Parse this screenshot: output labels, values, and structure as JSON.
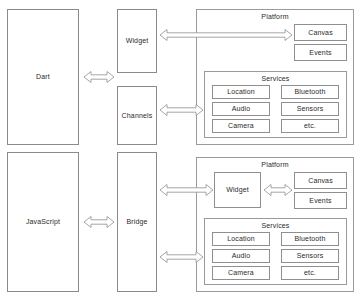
{
  "diagram": {
    "caption": "",
    "colors": {
      "box_border": "#8a8a8a",
      "container_border": "#9a9a9a",
      "arrow_stroke": "#8f8f8f",
      "arrow_fill": "#ffffff",
      "text": "#2a2a2a",
      "background": "#ffffff"
    },
    "panels": [
      {
        "id": "dart-panel",
        "language": {
          "label": "Dart"
        },
        "middle_boxes": [
          {
            "id": "widget",
            "label": "Widget"
          },
          {
            "id": "channels",
            "label": "Channels"
          }
        ],
        "platform": {
          "label": "Platform",
          "has_widget": false,
          "widget_label": "",
          "render_boxes": [
            {
              "id": "canvas",
              "label": "Canvas"
            },
            {
              "id": "events",
              "label": "Events"
            }
          ],
          "services": {
            "label": "Services",
            "left_column": [
              {
                "id": "location",
                "label": "Location"
              },
              {
                "id": "audio",
                "label": "Audio"
              },
              {
                "id": "camera",
                "label": "Camera"
              }
            ],
            "right_column": [
              {
                "id": "bluetooth",
                "label": "Bluetooth"
              },
              {
                "id": "sensors",
                "label": "Sensors"
              },
              {
                "id": "etc",
                "label": "etc."
              }
            ]
          }
        }
      },
      {
        "id": "javascript-panel",
        "language": {
          "label": "JavaScript"
        },
        "middle_boxes": [
          {
            "id": "bridge",
            "label": "Bridge"
          }
        ],
        "platform": {
          "label": "Platform",
          "has_widget": true,
          "widget_label": "Widget",
          "render_boxes": [
            {
              "id": "canvas",
              "label": "Canvas"
            },
            {
              "id": "events",
              "label": "Events"
            }
          ],
          "services": {
            "label": "Services",
            "left_column": [
              {
                "id": "location",
                "label": "Location"
              },
              {
                "id": "audio",
                "label": "Audio"
              },
              {
                "id": "camera",
                "label": "Camera"
              }
            ],
            "right_column": [
              {
                "id": "bluetooth",
                "label": "Bluetooth"
              },
              {
                "id": "sensors",
                "label": "Sensors"
              },
              {
                "id": "etc",
                "label": "etc."
              }
            ]
          }
        }
      }
    ],
    "connectors": [
      {
        "id": "dart-to-middle",
        "type": "double",
        "from": "Dart",
        "to": "Widget/Channels"
      },
      {
        "id": "widget-to-canvas",
        "type": "double",
        "from": "Widget",
        "to": "Canvas"
      },
      {
        "id": "channels-to-services",
        "type": "double",
        "from": "Channels",
        "to": "Services"
      },
      {
        "id": "javascript-to-bridge",
        "type": "double",
        "from": "JavaScript",
        "to": "Bridge"
      },
      {
        "id": "bridge-to-widget",
        "type": "double",
        "from": "Bridge",
        "to": "Widget"
      },
      {
        "id": "bridge-to-services",
        "type": "double",
        "from": "Bridge",
        "to": "Services"
      },
      {
        "id": "platform-widget-to-canvas",
        "type": "double",
        "from": "Widget",
        "to": "Canvas"
      }
    ]
  }
}
